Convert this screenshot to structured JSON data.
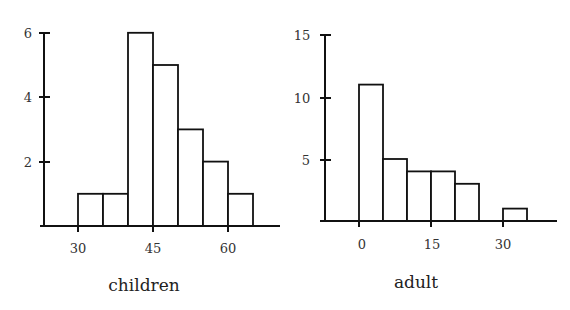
{
  "chart_data": [
    {
      "type": "bar",
      "title": "",
      "xlabel": "children",
      "ylabel": "",
      "bin_edges": [
        30,
        35,
        40,
        45,
        50,
        55,
        60,
        65
      ],
      "categories": [
        "30-35",
        "35-40",
        "40-45",
        "45-50",
        "50-55",
        "55-60",
        "60-65"
      ],
      "values": [
        1,
        1,
        6,
        5,
        3,
        2,
        1
      ],
      "x_ticks": [
        30,
        45,
        60
      ],
      "y_ticks": [
        2,
        4,
        6
      ],
      "ylim": [
        0,
        6
      ],
      "grid": false,
      "legend": null
    },
    {
      "type": "bar",
      "title": "",
      "xlabel": "adult",
      "ylabel": "",
      "bin_edges": [
        0,
        5,
        10,
        15,
        20,
        25,
        30,
        35
      ],
      "categories": [
        "0-5",
        "5-10",
        "10-15",
        "15-20",
        "20-25",
        "25-30",
        "30-35"
      ],
      "values": [
        11,
        5,
        4,
        4,
        3,
        0,
        1
      ],
      "x_ticks": [
        0,
        15,
        30
      ],
      "y_ticks": [
        5,
        10,
        15
      ],
      "ylim": [
        0,
        15
      ],
      "grid": false,
      "legend": null
    }
  ],
  "labels": {
    "left": {
      "xlabel": "children",
      "xticks": [
        "30",
        "45",
        "60"
      ],
      "yticks": [
        "2",
        "4",
        "6"
      ]
    },
    "right": {
      "xlabel": "adult",
      "xticks": [
        "0",
        "15",
        "30"
      ],
      "yticks": [
        "5",
        "10",
        "15"
      ]
    }
  }
}
